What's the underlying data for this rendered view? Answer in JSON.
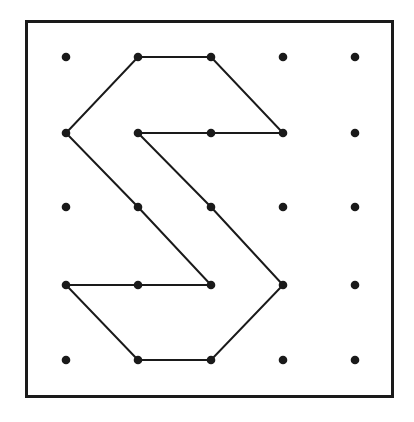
{
  "figure": {
    "canvas": {
      "width": 414,
      "height": 422,
      "background": "#ffffff"
    },
    "frame": {
      "name": "geoboard-frame",
      "x": 26,
      "y": 21,
      "width": 366,
      "height": 375,
      "stroke": "#1a1a1a",
      "stroke_width": 3,
      "fill": "#ffffff"
    },
    "grid": {
      "columns": 5,
      "rows": 5,
      "column_x": [
        66,
        138,
        211,
        283,
        355
      ],
      "row_y": [
        57,
        133,
        207,
        285,
        360
      ],
      "dot_radius": 4.3,
      "dot_color": "#1a1a1a"
    },
    "pegs": [
      {
        "col": 0,
        "row": 0,
        "x": 66,
        "y": 57,
        "on_path": false
      },
      {
        "col": 1,
        "row": 0,
        "x": 138,
        "y": 57,
        "on_path": true
      },
      {
        "col": 2,
        "row": 0,
        "x": 211,
        "y": 57,
        "on_path": true
      },
      {
        "col": 3,
        "row": 0,
        "x": 283,
        "y": 57,
        "on_path": false
      },
      {
        "col": 4,
        "row": 0,
        "x": 355,
        "y": 57,
        "on_path": false
      },
      {
        "col": 0,
        "row": 1,
        "x": 66,
        "y": 133,
        "on_path": true
      },
      {
        "col": 1,
        "row": 1,
        "x": 138,
        "y": 133,
        "on_path": true
      },
      {
        "col": 2,
        "row": 1,
        "x": 211,
        "y": 133,
        "on_path": true
      },
      {
        "col": 3,
        "row": 1,
        "x": 283,
        "y": 133,
        "on_path": true
      },
      {
        "col": 4,
        "row": 1,
        "x": 355,
        "y": 133,
        "on_path": false
      },
      {
        "col": 0,
        "row": 2,
        "x": 66,
        "y": 207,
        "on_path": false
      },
      {
        "col": 1,
        "row": 2,
        "x": 138,
        "y": 207,
        "on_path": true
      },
      {
        "col": 2,
        "row": 2,
        "x": 211,
        "y": 207,
        "on_path": true
      },
      {
        "col": 3,
        "row": 2,
        "x": 283,
        "y": 207,
        "on_path": false
      },
      {
        "col": 4,
        "row": 2,
        "x": 355,
        "y": 207,
        "on_path": false
      },
      {
        "col": 0,
        "row": 3,
        "x": 66,
        "y": 285,
        "on_path": true
      },
      {
        "col": 1,
        "row": 3,
        "x": 138,
        "y": 285,
        "on_path": true
      },
      {
        "col": 2,
        "row": 3,
        "x": 211,
        "y": 285,
        "on_path": true
      },
      {
        "col": 3,
        "row": 3,
        "x": 283,
        "y": 285,
        "on_path": true
      },
      {
        "col": 4,
        "row": 3,
        "x": 355,
        "y": 285,
        "on_path": false
      },
      {
        "col": 0,
        "row": 4,
        "x": 66,
        "y": 360,
        "on_path": false
      },
      {
        "col": 1,
        "row": 4,
        "x": 138,
        "y": 360,
        "on_path": true
      },
      {
        "col": 2,
        "row": 4,
        "x": 211,
        "y": 360,
        "on_path": true
      },
      {
        "col": 3,
        "row": 4,
        "x": 283,
        "y": 360,
        "on_path": false
      },
      {
        "col": 4,
        "row": 4,
        "x": 355,
        "y": 360,
        "on_path": false
      }
    ],
    "polygon": {
      "name": "s-shape-polygon",
      "closed": true,
      "stroke": "#1a1a1a",
      "stroke_width": 2,
      "fill": "none",
      "vertices_grid": [
        [
          1,
          0
        ],
        [
          2,
          0
        ],
        [
          3,
          1
        ],
        [
          1,
          1
        ],
        [
          2,
          2
        ],
        [
          3,
          3
        ],
        [
          2,
          4
        ],
        [
          1,
          4
        ],
        [
          0,
          3
        ],
        [
          2,
          3
        ],
        [
          1,
          2
        ],
        [
          0,
          1
        ]
      ],
      "vertices_px": [
        [
          138,
          57
        ],
        [
          211,
          57
        ],
        [
          283,
          133
        ],
        [
          138,
          133
        ],
        [
          211,
          207
        ],
        [
          283,
          285
        ],
        [
          211,
          360
        ],
        [
          138,
          360
        ],
        [
          66,
          285
        ],
        [
          211,
          285
        ],
        [
          138,
          207
        ],
        [
          66,
          133
        ]
      ],
      "points_attr": "138,57 211,57 283,133 138,133 211,207 283,285 211,360 138,360 66,285 211,285 138,207 66,133"
    }
  }
}
